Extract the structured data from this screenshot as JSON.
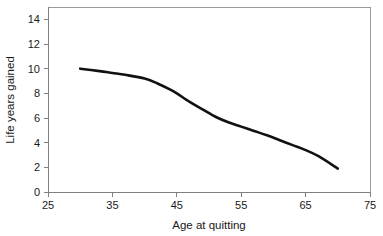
{
  "chart_data": {
    "type": "line",
    "title": "",
    "xlabel": "Age at quitting",
    "ylabel": "Life years gained",
    "xlim": [
      25,
      75
    ],
    "ylim": [
      0,
      15
    ],
    "xticks": [
      25,
      35,
      45,
      55,
      65,
      75
    ],
    "yticks": [
      0,
      2,
      4,
      6,
      8,
      10,
      12,
      14
    ],
    "xtick_labels": [
      "25",
      "35",
      "45",
      "55",
      "65",
      "75"
    ],
    "ytick_labels": [
      "0",
      "2",
      "4",
      "6",
      "8",
      "10",
      "12",
      "14"
    ],
    "grid": false,
    "legend": null,
    "series": [
      {
        "name": "Life years gained",
        "color": "#111111",
        "x": [
          30,
          33,
          35,
          37,
          40,
          42,
          44,
          45,
          47,
          49,
          51,
          53,
          55,
          57,
          59,
          61,
          63,
          65,
          67,
          70
        ],
        "values": [
          10.0,
          9.8,
          9.65,
          9.5,
          9.2,
          8.8,
          8.3,
          8.0,
          7.3,
          6.7,
          6.1,
          5.65,
          5.3,
          4.95,
          4.6,
          4.2,
          3.8,
          3.4,
          2.9,
          1.9
        ]
      }
    ],
    "annotations": []
  },
  "axes": {
    "x_axis_title": "Age at quitting",
    "y_axis_title": "Life years gained"
  }
}
